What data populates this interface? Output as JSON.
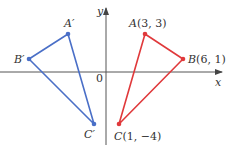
{
  "diagram": {
    "title": "",
    "axes": {
      "x_label": "x",
      "y_label": "y",
      "origin_label": "0",
      "origin_px": [
        106,
        72
      ],
      "scale_px_per_unit": [
        13,
        12.7
      ],
      "color": "#555555"
    },
    "triangles": [
      {
        "name": "original",
        "color": "#e0393b",
        "vertices": [
          {
            "id": "A",
            "label": "A(3, 3)",
            "coords": [
              3,
              3
            ]
          },
          {
            "id": "B",
            "label": "B(6, 1)",
            "coords": [
              6,
              1
            ]
          },
          {
            "id": "C",
            "label": "C(1, −4)",
            "coords": [
              1,
              -4
            ]
          }
        ]
      },
      {
        "name": "reflected",
        "color": "#4a6fc7",
        "vertices": [
          {
            "id": "A'",
            "label": "A′",
            "coords": [
              -3,
              3
            ]
          },
          {
            "id": "B'",
            "label": "B′",
            "coords": [
              -6,
              1
            ]
          },
          {
            "id": "C'",
            "label": "C′",
            "coords": [
              -1,
              -4
            ]
          }
        ]
      }
    ]
  }
}
